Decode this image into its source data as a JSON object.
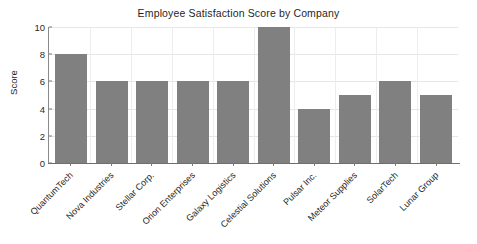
{
  "chart_data": {
    "type": "bar",
    "title": "Employee Satisfaction Score by Company",
    "xlabel": "",
    "ylabel": "Score",
    "categories": [
      "QuantumTech",
      "Nova Industries",
      "Stellar Corp.",
      "Orion Enterprises",
      "Galaxy Logistics",
      "Celestial Solutions",
      "Pulsar Inc.",
      "Meteor Supplies",
      "SolarTech",
      "Lunar Group"
    ],
    "values": [
      8,
      6,
      6,
      6,
      6,
      10,
      4,
      5,
      6,
      5
    ],
    "ylim": [
      0,
      10
    ],
    "ytick_labels": [
      "0",
      "2",
      "4",
      "6",
      "8",
      "10"
    ],
    "ytick_values": [
      0,
      2,
      4,
      6,
      8,
      10
    ],
    "grid": true,
    "legend": "none",
    "bar_color": "#808080",
    "grid_color": "#e6e6e6",
    "axis_color": "#6e6e6e",
    "background_color": "#ffffff",
    "xtick_label_rotation": 45
  }
}
